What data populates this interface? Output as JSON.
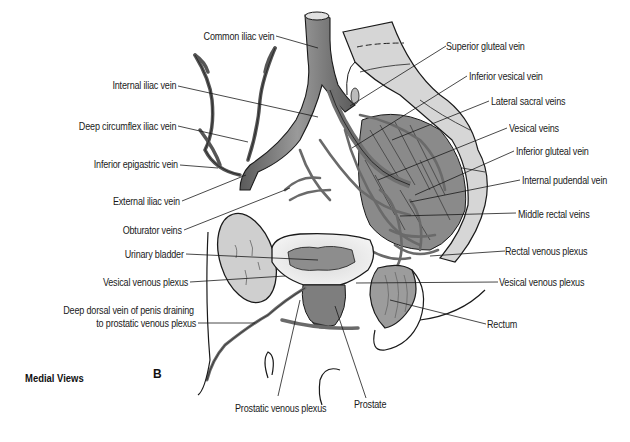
{
  "figure": {
    "view_caption": "Medial Views",
    "panel_letter": "B",
    "colors": {
      "background": "#ffffff",
      "vein": "#6f6f6f",
      "vein_light": "#a8a8a8",
      "bone": "#d2d2d2",
      "outline": "#1a1a1a",
      "label_text": "#1a1a1a"
    },
    "labels_left": [
      {
        "text": "Common iliac vein"
      },
      {
        "text": "Internal iliac vein"
      },
      {
        "text": "Deep circumflex iliac vein"
      },
      {
        "text": "Inferior epigastric vein"
      },
      {
        "text": "External iliac vein"
      },
      {
        "text": "Obturator veins"
      },
      {
        "text": "Urinary bladder"
      },
      {
        "text": "Vesical venous plexus"
      },
      {
        "text": "Deep dorsal vein of penis draining"
      },
      {
        "text": "to prostatic venous plexus"
      }
    ],
    "labels_right": [
      {
        "text": "Superior gluteal vein"
      },
      {
        "text": "Inferior vesical vein"
      },
      {
        "text": "Lateral sacral veins"
      },
      {
        "text": "Vesical veins"
      },
      {
        "text": "Inferior gluteal vein"
      },
      {
        "text": "Internal pudendal vein"
      },
      {
        "text": "Middle rectal veins"
      },
      {
        "text": "Rectal venous plexus"
      },
      {
        "text": "Vesical venous plexus"
      },
      {
        "text": "Rectum"
      }
    ],
    "labels_bottom": [
      {
        "text": "Prostatic venous plexus"
      },
      {
        "text": "Prostate"
      }
    ]
  }
}
